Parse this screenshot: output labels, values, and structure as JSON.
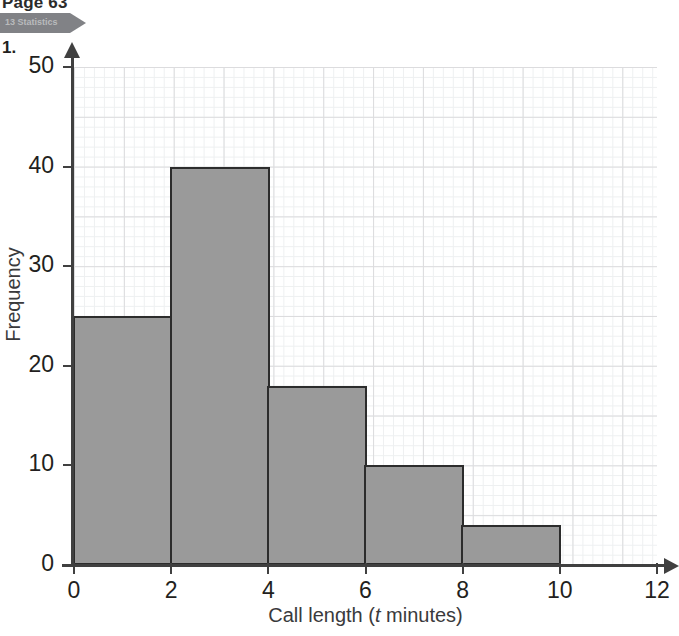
{
  "page": {
    "header_text": "Page 63",
    "chapter_banner_label": "13 Statistics",
    "question_number": "1."
  },
  "chart_data": {
    "type": "bar",
    "title": "",
    "subtitle": "",
    "xlabel": "Call length (t minutes)",
    "xlabel_plain": "Call length (",
    "xlabel_italic": "t",
    "xlabel_tail": " minutes)",
    "ylabel": "Frequency",
    "categories": [
      "0-2",
      "2-4",
      "4-6",
      "6-8",
      "8-10"
    ],
    "bin_edges": [
      0,
      2,
      4,
      6,
      8,
      10
    ],
    "values": [
      25,
      40,
      18,
      10,
      4
    ],
    "xlim": [
      0,
      12
    ],
    "ylim": [
      0,
      50
    ],
    "xticks": [
      0,
      2,
      4,
      6,
      8,
      10,
      12
    ],
    "yticks": [
      0,
      10,
      20,
      30,
      40,
      50
    ],
    "xtick_labels": [
      "0",
      "2",
      "4",
      "6",
      "8",
      "10",
      "12"
    ],
    "ytick_labels": [
      "0",
      "10",
      "20",
      "30",
      "40",
      "50"
    ],
    "grid": true,
    "grid_minor_step_x": 0.2,
    "grid_minor_step_y": 1,
    "grid_major_step_x": 1,
    "grid_major_step_y": 5,
    "legend": null,
    "bar_fill_color": "#9a9a9a",
    "bar_edge_color": "#2c2c2c",
    "axis_color": "#404040",
    "grid_major_color": "#dcdcde",
    "grid_minor_color": "#eef0f1",
    "banner_color": "#818286"
  }
}
